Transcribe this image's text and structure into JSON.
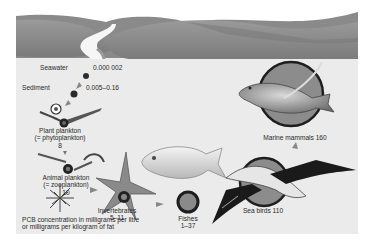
{
  "figure": {
    "caption_line1": "PCB concentration in milligrams per litre",
    "caption_line2": "or milligrams per kilogram of fat"
  },
  "nodes": {
    "seawater": {
      "label": "Seawater",
      "value": "0.000 002"
    },
    "sediment": {
      "label": "Sediment",
      "value": "0.005–0.16"
    },
    "phytoplankton": {
      "label": "Plant plankton",
      "sublabel": "(= phytoplankton)",
      "value": "8"
    },
    "zooplankton": {
      "label": "Animal plankton",
      "sublabel": "(= zooplankton)",
      "value": "10"
    },
    "invertebrates": {
      "label": "Invertebrates",
      "value": "5–11"
    },
    "fishes": {
      "label": "Fishes",
      "value": "1–37"
    },
    "sea_birds": {
      "label": "Sea birds",
      "value": "110",
      "full": "Sea birds 110"
    },
    "marine_mammals": {
      "label": "Marine mammals",
      "value": "160",
      "full": "Marine mammals 160"
    }
  },
  "colors": {
    "hills": "#8c8c8c",
    "hills_dark": "#6f6f6f",
    "water": "#ececec",
    "ring": "#1e1e1e",
    "circle_fill": "#8a8a8a"
  }
}
